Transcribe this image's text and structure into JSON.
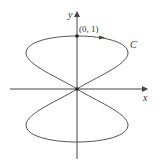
{
  "diagram": {
    "type": "parametric-curve-figure-eight",
    "axes": {
      "x_label": "x",
      "y_label": "y"
    },
    "curve_label": "C",
    "marked_point": {
      "label": "(0, 1)"
    },
    "colors": {
      "curve": "#555555",
      "axes": "#444444",
      "text": "#333333"
    }
  }
}
